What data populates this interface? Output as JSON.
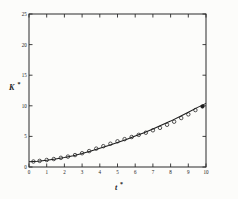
{
  "figure": {
    "name": "k-star-vs-t-star-plot",
    "background_color": "#fcfcfa",
    "ink_color": "#1d1d1d"
  },
  "chart_data": {
    "type": "scatter",
    "title": "",
    "subtitle": "",
    "xlabel": "t*",
    "ylabel": "K*",
    "xlabel_base": "t",
    "xlabel_sup": "*",
    "ylabel_base": "K",
    "ylabel_sup": "*",
    "xlim": [
      0,
      10
    ],
    "ylim": [
      0,
      25
    ],
    "xticks": [
      0,
      1,
      2,
      3,
      4,
      5,
      6,
      7,
      8,
      9,
      10
    ],
    "xticklabels": [
      "0",
      "1",
      "2",
      "3",
      "4",
      "5",
      "6",
      "7",
      "8",
      "9",
      "10"
    ],
    "yticks": [
      0,
      5,
      10,
      15,
      20,
      25
    ],
    "yticklabels": [
      "0",
      "5",
      "10",
      "15",
      "20",
      "25"
    ],
    "grid": false,
    "legend": null,
    "frame": "box",
    "tick_direction": "in",
    "series": [
      {
        "name": "data",
        "marker": "open-circle",
        "style": "points",
        "x": [
          0.25,
          0.6,
          1.0,
          1.4,
          1.8,
          2.2,
          2.6,
          3.0,
          3.4,
          3.8,
          4.2,
          4.6,
          5.0,
          5.4,
          5.8,
          6.2,
          6.6,
          7.0,
          7.4,
          7.8,
          8.2,
          8.6,
          9.0,
          9.4,
          9.8
        ],
        "y": [
          0.9,
          1.0,
          1.15,
          1.3,
          1.5,
          1.7,
          1.95,
          2.25,
          2.6,
          3.0,
          3.4,
          3.8,
          4.2,
          4.55,
          4.9,
          5.25,
          5.6,
          6.0,
          6.4,
          6.9,
          7.4,
          8.0,
          8.6,
          9.3,
          9.9
        ]
      },
      {
        "name": "model-curve",
        "marker": "none",
        "style": "line",
        "x": [
          0.0,
          0.5,
          1.0,
          1.5,
          2.0,
          2.5,
          3.0,
          3.5,
          4.0,
          4.5,
          5.0,
          5.5,
          6.0,
          6.5,
          7.0,
          7.5,
          8.0,
          8.5,
          9.0,
          9.5,
          10.0
        ],
        "y": [
          0.85,
          0.95,
          1.1,
          1.3,
          1.55,
          1.85,
          2.2,
          2.6,
          3.05,
          3.5,
          4.0,
          4.5,
          5.05,
          5.6,
          6.2,
          6.85,
          7.5,
          8.2,
          8.95,
          9.7,
          10.4
        ]
      }
    ],
    "annotations": []
  }
}
